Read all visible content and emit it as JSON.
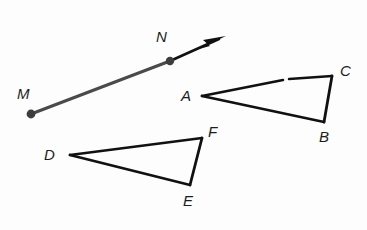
{
  "figure": {
    "kind": "geometry-diagram",
    "background_color": "#fdfdfd",
    "width": 367,
    "height": 230,
    "ray": {
      "name": "ray-MN",
      "stroke_color": "#4a4a4a",
      "arrow_stroke_color": "#111111",
      "stroke_width": 3,
      "endpoint_dot_color": "#3d3d3d",
      "endpoint_dot_radius": 4.2,
      "start": {
        "label": "M",
        "x": 31,
        "y": 114
      },
      "through": {
        "label": "N",
        "x": 170,
        "y": 61
      },
      "arrow_tip": {
        "x": 226,
        "y": 36
      }
    },
    "triangles": [
      {
        "name": "triangle-ABC",
        "stroke_color": "#111111",
        "stroke_width": 2.6,
        "vertices": [
          {
            "label": "A",
            "x": 202,
            "y": 96
          },
          {
            "label": "B",
            "x": 324,
            "y": 122
          },
          {
            "label": "C",
            "x": 332,
            "y": 76
          }
        ]
      },
      {
        "name": "triangle-DEF",
        "stroke_color": "#111111",
        "stroke_width": 2.6,
        "vertices": [
          {
            "label": "D",
            "x": 70,
            "y": 155
          },
          {
            "label": "E",
            "x": 190,
            "y": 185
          },
          {
            "label": "F",
            "x": 202,
            "y": 138
          }
        ]
      }
    ]
  },
  "labels": {
    "M": "M",
    "N": "N",
    "A": "A",
    "B": "B",
    "C": "C",
    "D": "D",
    "E": "E",
    "F": "F"
  }
}
